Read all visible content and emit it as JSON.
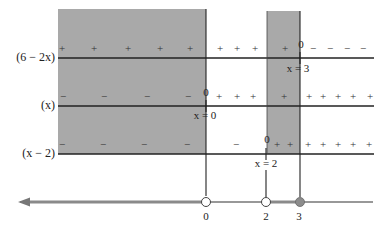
{
  "colors": {
    "shade": "#a9a9a9",
    "line": "#222222",
    "number_line_thick": "#8a8a8a",
    "filled_point": "#8c8c8c"
  },
  "rows": [
    {
      "label": "(6 − 2x)",
      "zero_label": "0",
      "zero_eq": "x = 3",
      "signs": {
        "left_shaded": [
          "+",
          "+",
          "+",
          "+",
          "+"
        ],
        "middle": [
          "+",
          "+",
          "+"
        ],
        "strip": [
          "+"
        ],
        "right": [
          "−",
          "−",
          "−",
          "−"
        ]
      }
    },
    {
      "label": "(x)",
      "zero_label": "0",
      "zero_eq": "x = 0",
      "signs": {
        "left_shaded": [
          "−",
          "−",
          "−",
          "−"
        ],
        "middle": [
          "+",
          "+",
          "+"
        ],
        "strip": [
          "+"
        ],
        "right": [
          "+",
          "+",
          "+",
          "+",
          "+"
        ]
      }
    },
    {
      "label": "(x − 2)",
      "zero_label": "0",
      "zero_eq": "x = 2",
      "signs": {
        "left_shaded": [
          "−",
          "−",
          "−",
          "−"
        ],
        "middle": [
          "−"
        ],
        "strip": [
          "+",
          "+"
        ],
        "right": [
          "+",
          "+",
          "+",
          "+",
          "+"
        ]
      }
    }
  ],
  "number_line": {
    "ticks": [
      {
        "value": "0",
        "point": "open"
      },
      {
        "value": "2",
        "point": "open"
      },
      {
        "value": "3",
        "point": "closed"
      }
    ],
    "solution_intervals": [
      "(-∞, 0)",
      "(2, 3]"
    ]
  }
}
